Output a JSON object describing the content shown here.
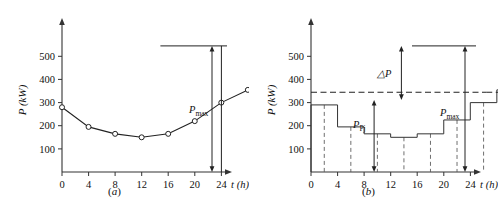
{
  "figure": {
    "panels": [
      {
        "id": "a",
        "caption": "(a)",
        "caption_letter": "a",
        "xlabel": "t (h)",
        "ylabel": "P (kW)",
        "annotation_pmax": "P",
        "annotation_pmax_sub": "max"
      },
      {
        "id": "b",
        "caption": "(b)",
        "caption_letter": "b",
        "xlabel": "t (h)",
        "ylabel": "P (kW)",
        "annotation_pmax": "P",
        "annotation_pmax_sub": "max",
        "annotation_ppj": "P",
        "annotation_ppj_sub": "Pj",
        "annotation_dp": "△P"
      }
    ]
  },
  "chart_data": [
    {
      "type": "line",
      "id": "a",
      "title": "(a)",
      "xlabel": "t (h)",
      "ylabel": "P (kW)",
      "xlim": [
        0,
        25
      ],
      "ylim": [
        0,
        580
      ],
      "xticks": [
        0,
        4,
        8,
        12,
        16,
        20,
        24
      ],
      "xticklabels": [
        "0",
        "4",
        "8",
        "12",
        "16",
        "20",
        "24"
      ],
      "yticks": [
        100,
        200,
        300,
        400,
        500
      ],
      "yticklabels": [
        "100",
        "200",
        "300",
        "400",
        "500"
      ],
      "grid": false,
      "legend": false,
      "markers": "open-circle",
      "x": [
        0,
        1,
        2,
        3,
        4,
        5,
        6,
        7,
        8,
        9,
        10,
        11,
        12,
        13,
        14,
        15,
        16,
        17,
        18,
        19,
        20,
        21,
        22,
        23,
        24
      ],
      "values": [
        280,
        195,
        165,
        150,
        165,
        220,
        300,
        355,
        400,
        385,
        375,
        300,
        280,
        305,
        370,
        385,
        465,
        520,
        545,
        530,
        515,
        490,
        400,
        350,
        280
      ],
      "annotations": [
        {
          "label": "Pmax",
          "text": "P_max",
          "kind": "double-arrow-vertical",
          "from": 0,
          "to": 545,
          "at_x": 25
        }
      ]
    },
    {
      "type": "bar",
      "id": "b",
      "title": "(b)",
      "xlabel": "t (h)",
      "ylabel": "P (kW)",
      "xlim": [
        0,
        25
      ],
      "ylim": [
        0,
        580
      ],
      "xticks": [
        0,
        4,
        8,
        12,
        16,
        20,
        24
      ],
      "xticklabels": [
        "0",
        "4",
        "8",
        "12",
        "16",
        "20",
        "24"
      ],
      "yticks": [
        100,
        200,
        300,
        400,
        500
      ],
      "yticklabels": [
        "100",
        "200",
        "300",
        "400",
        "500"
      ],
      "grid": false,
      "legend": false,
      "categories": [
        "0-1",
        "1-2",
        "2-3",
        "3-4",
        "4-5",
        "5-6",
        "6-7",
        "7-8",
        "8-9",
        "9-10",
        "10-11",
        "11-12",
        "12-13",
        "13-14",
        "14-15",
        "15-16",
        "16-17",
        "17-18",
        "18-19",
        "19-20",
        "20-21",
        "21-22",
        "22-23",
        "23-24"
      ],
      "values": [
        290,
        195,
        165,
        150,
        165,
        225,
        300,
        355,
        395,
        375,
        370,
        300,
        280,
        305,
        350,
        385,
        465,
        520,
        545,
        530,
        515,
        490,
        400,
        350
      ],
      "annotations": [
        {
          "label": "Pmax",
          "text": "P_max",
          "kind": "double-arrow-vertical",
          "from": 0,
          "to": 545,
          "at_x": 25
        },
        {
          "label": "Ppj",
          "text": "P_Pj",
          "kind": "double-arrow-vertical",
          "from": 0,
          "to": 345,
          "at_x": 9.5
        },
        {
          "label": "dP",
          "text": "△P",
          "kind": "double-arrow-vertical",
          "from": 345,
          "to": 545,
          "at_x": 13.6
        },
        {
          "label": "average-line",
          "text": "",
          "kind": "dashed-horizontal",
          "y": 345
        }
      ]
    }
  ]
}
